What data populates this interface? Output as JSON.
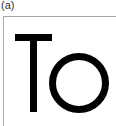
{
  "panel": {
    "label": "(a)",
    "text": "To"
  },
  "colors": {
    "frame_border": "#a8a8a8",
    "glyph": "#000000",
    "label": "#333333",
    "background": "#ffffff"
  }
}
